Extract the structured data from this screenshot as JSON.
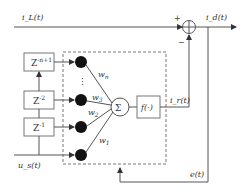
{
  "diagram": {
    "type": "adaptive neural filter block diagram",
    "signals": {
      "input_top": "i_L(t)",
      "output": "i_d(t)",
      "input_bottom": "u_s(t)",
      "estimate": "i_r(t)",
      "error": "e(t)"
    },
    "delays": [
      {
        "label": "Z",
        "exp": "-n+1"
      },
      {
        "label": "Z",
        "exp": "-2"
      },
      {
        "label": "Z",
        "exp": "-1"
      }
    ],
    "weights": [
      {
        "label": "w",
        "sub": "n"
      },
      {
        "label": "w",
        "sub": "3"
      },
      {
        "label": "w",
        "sub": "2"
      },
      {
        "label": "w",
        "sub": "1"
      }
    ],
    "summer": {
      "symbol": "Σ"
    },
    "activation": {
      "label": "f(·)"
    },
    "junction": {
      "plus": "+",
      "minus": "−"
    },
    "ellipsis": "⋮"
  }
}
